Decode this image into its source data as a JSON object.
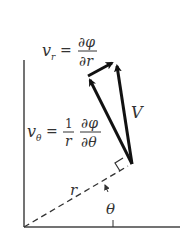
{
  "diagram": {
    "type": "velocity-components-polar",
    "labels": {
      "v_r": {
        "lhs": "v",
        "sub": "r",
        "eq": "=",
        "num": "∂φ",
        "den": "∂r"
      },
      "v_theta": {
        "lhs": "v",
        "sub": "θ",
        "eq": "=",
        "coef_num": "1",
        "coef_den": "r",
        "num": "∂φ",
        "den": "∂θ"
      },
      "V": "V",
      "r": "r",
      "theta": "θ"
    },
    "colors": {
      "ink": "#333333",
      "arrow": "#111111",
      "background": "#ffffff"
    }
  }
}
